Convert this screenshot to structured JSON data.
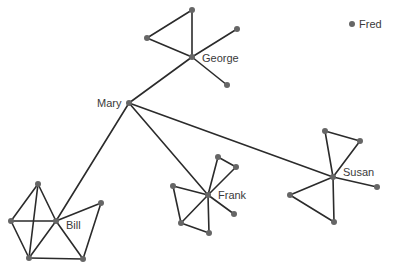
{
  "diagram": {
    "type": "network-graph",
    "colors": {
      "edge": "#2b2b2b",
      "node": "#666666",
      "label": "#3a3a3a",
      "background": "#ffffff"
    },
    "nodes": [
      {
        "id": "mary",
        "label": "Mary",
        "x": 129,
        "y": 103,
        "label_x": 97,
        "label_y": 107
      },
      {
        "id": "george",
        "label": "George",
        "x": 192,
        "y": 57,
        "label_x": 202,
        "label_y": 62
      },
      {
        "id": "g1",
        "label": "",
        "x": 192,
        "y": 10
      },
      {
        "id": "g2",
        "label": "",
        "x": 147,
        "y": 38
      },
      {
        "id": "g3",
        "label": "",
        "x": 237,
        "y": 29
      },
      {
        "id": "g4",
        "label": "",
        "x": 227,
        "y": 85
      },
      {
        "id": "fred",
        "label": "Fred",
        "x": 352,
        "y": 24,
        "label_x": 359,
        "label_y": 28
      },
      {
        "id": "bill",
        "label": "Bill",
        "x": 56,
        "y": 221,
        "label_x": 66,
        "label_y": 229
      },
      {
        "id": "b1",
        "label": "",
        "x": 38,
        "y": 184
      },
      {
        "id": "b2",
        "label": "",
        "x": 11,
        "y": 221
      },
      {
        "id": "b3",
        "label": "",
        "x": 101,
        "y": 203
      },
      {
        "id": "b4",
        "label": "",
        "x": 29,
        "y": 258
      },
      {
        "id": "b5",
        "label": "",
        "x": 83,
        "y": 259
      },
      {
        "id": "frank",
        "label": "Frank",
        "x": 208,
        "y": 195,
        "label_x": 218,
        "label_y": 199
      },
      {
        "id": "f1",
        "label": "",
        "x": 218,
        "y": 157
      },
      {
        "id": "f2",
        "label": "",
        "x": 236,
        "y": 167
      },
      {
        "id": "f3",
        "label": "",
        "x": 173,
        "y": 186
      },
      {
        "id": "f4",
        "label": "",
        "x": 234,
        "y": 214
      },
      {
        "id": "f5",
        "label": "",
        "x": 181,
        "y": 223
      },
      {
        "id": "f6",
        "label": "",
        "x": 209,
        "y": 233
      },
      {
        "id": "susan",
        "label": "Susan",
        "x": 333,
        "y": 177,
        "label_x": 343,
        "label_y": 176
      },
      {
        "id": "s1",
        "label": "",
        "x": 325,
        "y": 131
      },
      {
        "id": "s2",
        "label": "",
        "x": 360,
        "y": 141
      },
      {
        "id": "s3",
        "label": "",
        "x": 377,
        "y": 187
      },
      {
        "id": "s4",
        "label": "",
        "x": 290,
        "y": 195
      },
      {
        "id": "s5",
        "label": "",
        "x": 334,
        "y": 222
      }
    ],
    "edges": [
      [
        "mary",
        "george"
      ],
      [
        "mary",
        "bill"
      ],
      [
        "mary",
        "frank"
      ],
      [
        "mary",
        "susan"
      ],
      [
        "george",
        "g1"
      ],
      [
        "george",
        "g2"
      ],
      [
        "g1",
        "g2"
      ],
      [
        "george",
        "g3"
      ],
      [
        "george",
        "g4"
      ],
      [
        "bill",
        "b1"
      ],
      [
        "bill",
        "b2"
      ],
      [
        "bill",
        "b3"
      ],
      [
        "bill",
        "b4"
      ],
      [
        "bill",
        "b5"
      ],
      [
        "b1",
        "b2"
      ],
      [
        "b1",
        "b4"
      ],
      [
        "b2",
        "b4"
      ],
      [
        "b3",
        "b5"
      ],
      [
        "b4",
        "b5"
      ],
      [
        "frank",
        "f1"
      ],
      [
        "frank",
        "f2"
      ],
      [
        "f1",
        "f2"
      ],
      [
        "frank",
        "f3"
      ],
      [
        "frank",
        "f4"
      ],
      [
        "frank",
        "f5"
      ],
      [
        "frank",
        "f6"
      ],
      [
        "f3",
        "f5"
      ],
      [
        "f5",
        "f6"
      ],
      [
        "susan",
        "s1"
      ],
      [
        "susan",
        "s2"
      ],
      [
        "s1",
        "s2"
      ],
      [
        "susan",
        "s3"
      ],
      [
        "susan",
        "s4"
      ],
      [
        "susan",
        "s5"
      ],
      [
        "s4",
        "s5"
      ]
    ]
  }
}
